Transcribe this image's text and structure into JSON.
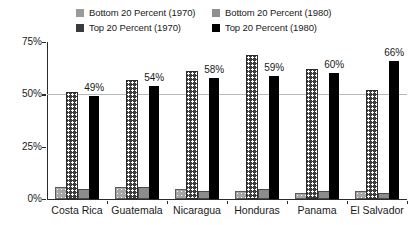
{
  "legend": {
    "items": [
      {
        "label": "Bottom 20 Percent (1970)",
        "swatch": "dotted-light-square-icon",
        "color": "#9a9a9a"
      },
      {
        "label": "Bottom 20 Percent (1980)",
        "swatch": "solid-gray-square-icon",
        "color": "#8f8f8f"
      },
      {
        "label": "Top 20 Percent (1970)",
        "swatch": "dotted-dark-square-icon",
        "color": "#3a3a3a"
      },
      {
        "label": "Top 20 Percent (1980)",
        "swatch": "solid-black-square-icon",
        "color": "#000000"
      }
    ]
  },
  "chart_data": {
    "type": "bar",
    "title": "",
    "subtitle": "",
    "xlabel": "",
    "ylabel": "",
    "ylim": [
      0,
      75
    ],
    "yticks": [
      0,
      25,
      50,
      75
    ],
    "ytick_labels": [
      "0%",
      "25%",
      "50%",
      "75%"
    ],
    "grid": "horizontal-at-50",
    "legend_position": "top-center",
    "categories": [
      "Costa Rica",
      "Guatemala",
      "Nicaragua",
      "Honduras",
      "Panama",
      "El Salvador"
    ],
    "series": [
      {
        "name": "Bottom 20 Percent (1970)",
        "color": "#9a9a9a",
        "pattern": "dotted",
        "values": [
          5,
          5,
          4,
          3,
          2,
          3
        ],
        "labels": [
          "",
          "",
          "",
          "",
          "",
          ""
        ]
      },
      {
        "name": "Top 20 Percent (1970)",
        "color": "#3a3a3a",
        "pattern": "dotted",
        "values": [
          50,
          56,
          60,
          68,
          61,
          51
        ],
        "labels": [
          "",
          "",
          "",
          "",
          "",
          ""
        ]
      },
      {
        "name": "Bottom 20 Percent (1980)",
        "color": "#8f8f8f",
        "pattern": "solid",
        "values": [
          4,
          5,
          3,
          4,
          3,
          2
        ],
        "labels": [
          "",
          "",
          "",
          "",
          "",
          ""
        ]
      },
      {
        "name": "Top 20 Percent (1980)",
        "color": "#000000",
        "pattern": "solid",
        "values": [
          49,
          54,
          58,
          59,
          60,
          66
        ],
        "labels": [
          "49%",
          "54%",
          "58%",
          "59%",
          "60%",
          "66%"
        ]
      }
    ]
  }
}
